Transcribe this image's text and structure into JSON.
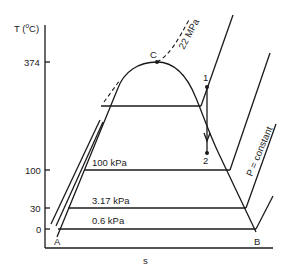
{
  "diagram": {
    "y_axis_label": "T (°C)",
    "y_axis_label_main": "T (",
    "y_axis_label_sup": "o",
    "y_axis_label_end": "C)",
    "x_axis_label": "s",
    "y_ticks": [
      "374",
      "100",
      "30",
      "0"
    ],
    "points": {
      "critical": "C",
      "state1": "1",
      "state2": "2",
      "left": "A",
      "right": "B"
    },
    "isobars": {
      "critical": "22 MPa",
      "p100": "100 kPa",
      "p317": "3.17 kPa",
      "p06": "0.6 kPa",
      "generic": "P = constant"
    },
    "colors": {
      "line": "#1a1a1a",
      "background": "#ffffff"
    }
  }
}
